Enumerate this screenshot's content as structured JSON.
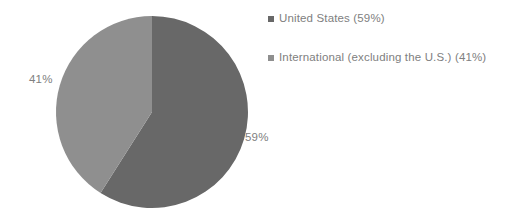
{
  "chart_data": {
    "type": "pie",
    "title": "",
    "categories": [
      "United States",
      "International (excluding the U.S.)"
    ],
    "values": [
      59,
      41
    ],
    "unit": "%",
    "slices": [
      {
        "name": "United States",
        "value": 59,
        "data_label": "59%",
        "legend_label": "United States (59%)",
        "color": "#686868",
        "start_angle_deg": 0,
        "end_angle_deg": 212.4
      },
      {
        "name": "International (excluding the U.S.)",
        "value": 41,
        "data_label": "41%",
        "legend_label": "International (excluding the U.S.) (41%)",
        "color": "#8f8f8f",
        "start_angle_deg": 212.4,
        "end_angle_deg": 360
      }
    ],
    "legend_position": "right",
    "grid": false,
    "label_color": "#808080",
    "background_color": "#ffffff"
  },
  "legend": {
    "items": [
      {
        "label": "United States (59%)",
        "color": "#686868"
      },
      {
        "label": "International (excluding the U.S.) (41%)",
        "color": "#8f8f8f"
      }
    ]
  },
  "labels": {
    "united_states": "59%",
    "international": "41%"
  }
}
